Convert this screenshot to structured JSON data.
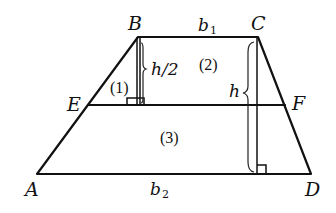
{
  "diagram": {
    "type": "geometry",
    "vertices": {
      "A": {
        "label": "A",
        "x": 37,
        "y": 174
      },
      "B": {
        "label": "B",
        "x": 138,
        "y": 37
      },
      "C": {
        "label": "C",
        "x": 258,
        "y": 37
      },
      "D": {
        "label": "D",
        "x": 311,
        "y": 174
      },
      "E": {
        "label": "E",
        "x": 88,
        "y": 105
      },
      "F": {
        "label": "F",
        "x": 285,
        "y": 105
      }
    },
    "labels": {
      "top_base": "b",
      "top_base_sub": "1",
      "bottom_base": "b",
      "bottom_base_sub": "2",
      "half_height": "h/2",
      "height": "h"
    },
    "regions": [
      {
        "id": "region-1",
        "label": "(1)"
      },
      {
        "id": "region-2",
        "label": "(2)"
      },
      {
        "id": "region-3",
        "label": "(3)"
      }
    ],
    "colors": {
      "stroke": "#111111",
      "background": "#ffffff"
    }
  }
}
